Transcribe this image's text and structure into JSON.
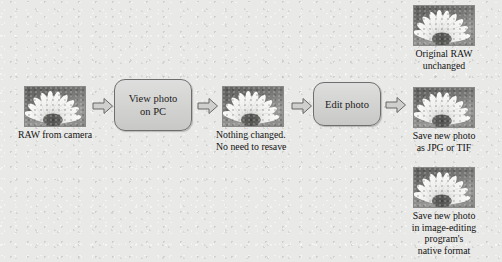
{
  "diagram": {
    "background_color": "#e9e9e7",
    "nodes": {
      "raw_source": {
        "caption": "RAW from camera",
        "image_alt": "sunflower-photo"
      },
      "view_step": {
        "label": "View photo\non PC"
      },
      "unchanged_photo": {
        "caption": "Nothing changed.\nNo need to resave",
        "image_alt": "sunflower-photo"
      },
      "edit_step": {
        "label": "Edit photo"
      },
      "output_original": {
        "caption": "Original RAW\nunchanged",
        "image_alt": "sunflower-photo"
      },
      "output_jpg_tif": {
        "caption": "Save new photo\nas JPG or TIF",
        "image_alt": "sunflower-photo"
      },
      "output_native": {
        "caption": "Save new photo\nin image-editing\nprogram's\nnative format",
        "image_alt": "sunflower-photo"
      }
    },
    "arrows": {
      "a1": "arrow-right-icon",
      "a2": "arrow-right-icon",
      "a3": "arrow-right-icon",
      "a4": "arrow-right-icon"
    }
  }
}
